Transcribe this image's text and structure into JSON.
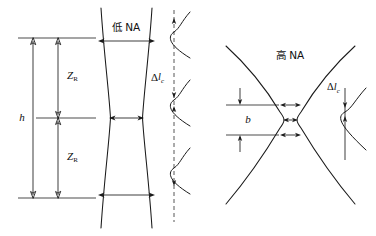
{
  "figure": {
    "background_color": "#ffffff",
    "ink_color": "#1a1a1a",
    "width": 376,
    "height": 236
  },
  "panels": [
    {
      "id": "low-na",
      "heading": "低 NA",
      "heading_meaning": "low NA",
      "dimensions": [
        {
          "name": "h",
          "symbol": "h",
          "orientation": "vertical",
          "description": "total beam height span"
        },
        {
          "name": "z-rayleigh-upper",
          "symbol": "Z",
          "subscript": "R",
          "orientation": "vertical",
          "description": "upper Rayleigh range"
        },
        {
          "name": "z-rayleigh-lower",
          "symbol": "Z",
          "subscript": "R",
          "orientation": "vertical",
          "description": "lower Rayleigh range"
        }
      ],
      "width_arrows": 3,
      "profile": {
        "label_symbol": "Δl",
        "label_subscript": "c",
        "peaks": 3,
        "axis_style": "dashed",
        "spacing_label": "Δl_c",
        "peak_width": "broad"
      }
    },
    {
      "id": "high-na",
      "heading": "高 NA",
      "heading_meaning": "high NA",
      "dimensions": [
        {
          "name": "b",
          "symbol": "b",
          "orientation": "vertical",
          "description": "confocal parameter"
        }
      ],
      "width_arrows": 3,
      "profile": {
        "label_symbol": "Δl",
        "label_subscript": "c",
        "peaks": 1,
        "axis_style": "solid",
        "spacing_label": "Δl_c",
        "peak_width": "narrow"
      }
    }
  ],
  "labels": {
    "low_na": "低 NA",
    "high_na": "高 NA",
    "h": "h",
    "z_symbol": "Z",
    "z_subscript": "R",
    "b": "b",
    "delta_symbol": "Δl",
    "delta_subscript": "c"
  }
}
